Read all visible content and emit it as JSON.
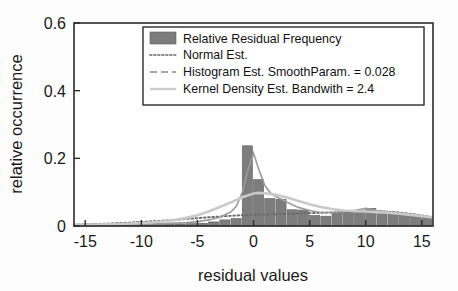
{
  "chart_data": {
    "type": "bar",
    "title": "",
    "xlabel": "residual values",
    "ylabel": "relative occurrence",
    "xlim": [
      -16,
      16
    ],
    "ylim": [
      0,
      0.6
    ],
    "xticks": [
      -15,
      -10,
      -5,
      0,
      5,
      10,
      15
    ],
    "xtick_labels": [
      "-15",
      "-10",
      "-5",
      "0",
      "5",
      "10",
      "15"
    ],
    "yticks": [
      0,
      0.2,
      0.4,
      0.6
    ],
    "ytick_labels": [
      "0",
      "0.2",
      "0.4",
      "0.6"
    ],
    "grid": false,
    "legend_position": "top-center",
    "bar_width": 1.0,
    "histogram": {
      "name": "Relative Residual Frequency",
      "color": "#7d7d7d",
      "x": [
        -15.5,
        -14.5,
        -13.5,
        -12.5,
        -11.5,
        -10.5,
        -9.5,
        -8.5,
        -7.5,
        -6.5,
        -5.5,
        -4.5,
        -3.5,
        -2.5,
        -1.5,
        -0.5,
        0.5,
        1.5,
        2.5,
        3.5,
        4.5,
        5.5,
        6.5,
        7.5,
        8.5,
        9.5,
        10.5,
        11.5,
        12.5,
        13.5,
        14.5,
        15.5
      ],
      "values": [
        0.002,
        0.002,
        0.003,
        0.003,
        0.004,
        0.004,
        0.004,
        0.005,
        0.005,
        0.006,
        0.007,
        0.008,
        0.012,
        0.018,
        0.022,
        0.237,
        0.137,
        0.081,
        0.079,
        0.048,
        0.047,
        0.031,
        0.029,
        0.04,
        0.04,
        0.041,
        0.052,
        0.041,
        0.038,
        0.034,
        0.03,
        0.026
      ]
    },
    "series": [
      {
        "name": "Normal Est.",
        "style": "dotted",
        "color": "#6e6e6e",
        "x": [
          -16,
          -15,
          -14,
          -13,
          -12,
          -11,
          -10,
          -9,
          -8,
          -7,
          -6,
          -5,
          -4,
          -3,
          -2,
          -1,
          0,
          1,
          2,
          3,
          4,
          5,
          6,
          7,
          8,
          9,
          10,
          11,
          12,
          13,
          14,
          15,
          16
        ],
        "values": [
          0.004,
          0.005,
          0.006,
          0.007,
          0.009,
          0.01,
          0.012,
          0.014,
          0.016,
          0.018,
          0.021,
          0.023,
          0.026,
          0.028,
          0.03,
          0.032,
          0.033,
          0.034,
          0.035,
          0.036,
          0.037,
          0.038,
          0.039,
          0.04,
          0.041,
          0.042,
          0.043,
          0.043,
          0.042,
          0.04,
          0.036,
          0.031,
          0.026
        ]
      },
      {
        "name": "Histogram Est. SmoothParam. = 0.028",
        "style": "dashed",
        "color": "#9b9b9b",
        "x": [
          -16,
          -14,
          -12,
          -10,
          -8,
          -6,
          -5,
          -4,
          -3,
          -2,
          -1.5,
          -1,
          -0.5,
          0,
          0.5,
          1,
          1.5,
          2,
          2.5,
          3,
          4,
          5,
          6,
          7,
          8,
          9,
          10,
          11,
          12,
          13,
          14,
          15,
          16
        ],
        "values": [
          0.002,
          0.003,
          0.004,
          0.005,
          0.007,
          0.01,
          0.013,
          0.018,
          0.026,
          0.042,
          0.06,
          0.1,
          0.165,
          0.215,
          0.165,
          0.12,
          0.098,
          0.086,
          0.079,
          0.07,
          0.055,
          0.046,
          0.04,
          0.04,
          0.042,
          0.046,
          0.052,
          0.046,
          0.042,
          0.038,
          0.034,
          0.03,
          0.026
        ]
      },
      {
        "name": "Kernel Density Est. Bandwith = 2.4",
        "style": "solid",
        "color": "#c9c9c9",
        "x": [
          -16,
          -14,
          -12,
          -10,
          -9,
          -8,
          -7,
          -6,
          -5,
          -4,
          -3,
          -2,
          -1,
          0,
          0.5,
          1,
          2,
          3,
          4,
          5,
          6,
          7,
          8,
          9,
          10,
          11,
          12,
          13,
          14,
          15,
          16
        ],
        "values": [
          0.003,
          0.004,
          0.006,
          0.009,
          0.011,
          0.014,
          0.018,
          0.024,
          0.032,
          0.043,
          0.056,
          0.07,
          0.085,
          0.096,
          0.098,
          0.097,
          0.092,
          0.084,
          0.074,
          0.064,
          0.056,
          0.05,
          0.046,
          0.044,
          0.043,
          0.041,
          0.039,
          0.036,
          0.033,
          0.029,
          0.025
        ]
      }
    ],
    "legend_entries": [
      {
        "label": "Relative Residual Frequency",
        "marker": "swatch"
      },
      {
        "label": "Normal Est.",
        "marker": "dotted-line"
      },
      {
        "label": "Histogram Est. SmoothParam. = 0.028",
        "marker": "dashed-line"
      },
      {
        "label": "Kernel Density Est. Bandwith = 2.4",
        "marker": "solid-line"
      }
    ]
  }
}
